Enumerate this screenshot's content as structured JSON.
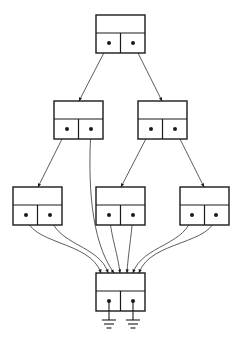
{
  "diagram": {
    "colors": {
      "stroke": "#1a1a1a",
      "background": "#ffffff"
    },
    "nodes": [
      {
        "id": "root",
        "x": 96,
        "y": 15,
        "w": 49,
        "h": 38
      },
      {
        "id": "mid-left",
        "x": 54,
        "y": 101,
        "w": 49,
        "h": 38
      },
      {
        "id": "mid-right",
        "x": 138,
        "y": 101,
        "w": 49,
        "h": 38
      },
      {
        "id": "low-left",
        "x": 13,
        "y": 187,
        "w": 49,
        "h": 38
      },
      {
        "id": "low-center",
        "x": 96,
        "y": 187,
        "w": 49,
        "h": 38
      },
      {
        "id": "low-right",
        "x": 180,
        "y": 187,
        "w": 49,
        "h": 38
      },
      {
        "id": "terminal",
        "x": 96,
        "y": 273,
        "w": 49,
        "h": 38
      }
    ],
    "edges": [
      {
        "from": "root.left",
        "to": "mid-left"
      },
      {
        "from": "root.right",
        "to": "mid-right"
      },
      {
        "from": "mid-left.left",
        "to": "low-left"
      },
      {
        "from": "mid-left.right",
        "to": "terminal"
      },
      {
        "from": "mid-right.left",
        "to": "low-center"
      },
      {
        "from": "mid-right.right",
        "to": "low-right"
      },
      {
        "from": "low-left.left",
        "to": "terminal"
      },
      {
        "from": "low-left.right",
        "to": "terminal"
      },
      {
        "from": "low-center.left",
        "to": "terminal"
      },
      {
        "from": "low-center.right",
        "to": "terminal"
      },
      {
        "from": "low-right.left",
        "to": "terminal"
      },
      {
        "from": "low-right.right",
        "to": "terminal"
      },
      {
        "from": "terminal.left",
        "to": "ground"
      },
      {
        "from": "terminal.right",
        "to": "ground"
      }
    ],
    "ground_count": 2
  }
}
